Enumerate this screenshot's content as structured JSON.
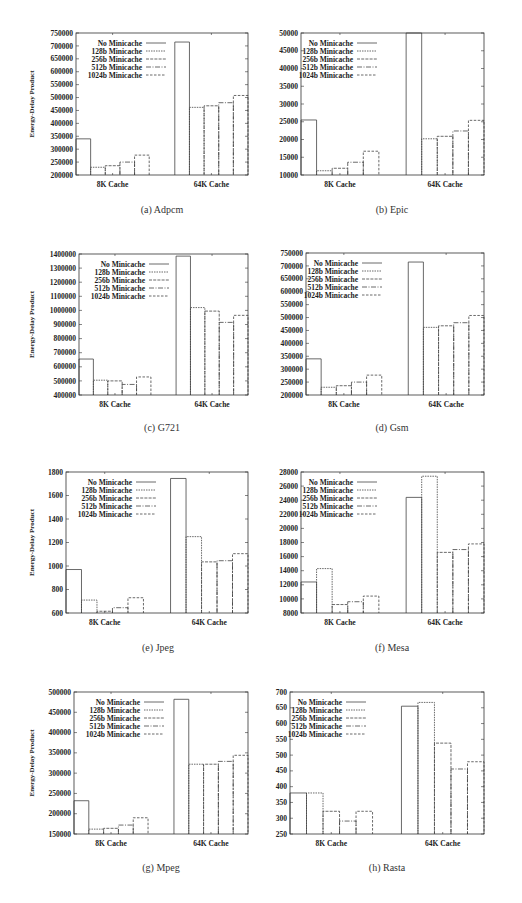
{
  "chart_data": [
    {
      "id": "a",
      "type": "bar",
      "title": "(a) Adpcm",
      "xlabel": "",
      "ylabel": "Energy-Delay Product",
      "categories": [
        "8K Cache",
        "64K Cache"
      ],
      "ylim": [
        200000,
        750000
      ],
      "yticks": [
        200000,
        250000,
        300000,
        350000,
        400000,
        450000,
        500000,
        550000,
        600000,
        650000,
        700000,
        750000
      ],
      "legend_position": "top-left",
      "grid": false,
      "series": [
        {
          "name": "No Minicache",
          "values": [
            340000,
            715000
          ]
        },
        {
          "name": "128b Minicache",
          "values": [
            230000,
            462000
          ]
        },
        {
          "name": "256b Minicache",
          "values": [
            236000,
            468000
          ]
        },
        {
          "name": "512b Minicache",
          "values": [
            250000,
            480000
          ]
        },
        {
          "name": "1024b Minicache",
          "values": [
            277000,
            508000
          ]
        }
      ]
    },
    {
      "id": "b",
      "type": "bar",
      "title": "(b) Epic",
      "xlabel": "",
      "ylabel": "",
      "categories": [
        "8K Cache",
        "64K Cache"
      ],
      "ylim": [
        10000,
        50000
      ],
      "yticks": [
        10000,
        15000,
        20000,
        25000,
        30000,
        35000,
        40000,
        45000,
        50000
      ],
      "legend_position": "top-left",
      "grid": false,
      "series": [
        {
          "name": "No Minicache",
          "values": [
            25500,
            50000
          ]
        },
        {
          "name": "128b Minicache",
          "values": [
            11200,
            20200
          ]
        },
        {
          "name": "256b Minicache",
          "values": [
            11900,
            20900
          ]
        },
        {
          "name": "512b Minicache",
          "values": [
            13600,
            22400
          ]
        },
        {
          "name": "1024b Minicache",
          "values": [
            16700,
            25400
          ]
        }
      ]
    },
    {
      "id": "c",
      "type": "bar",
      "title": "(c) G721",
      "xlabel": "",
      "ylabel": "Energy-Delay Product",
      "categories": [
        "8K Cache",
        "64K Cache"
      ],
      "ylim": [
        400000,
        1400000
      ],
      "yticks": [
        400000,
        500000,
        600000,
        700000,
        800000,
        900000,
        1000000,
        1100000,
        1200000,
        1300000,
        1400000
      ],
      "legend_position": "top-left",
      "grid": false,
      "series": [
        {
          "name": "No Minicache",
          "values": [
            655000,
            1385000
          ]
        },
        {
          "name": "128b Minicache",
          "values": [
            505000,
            1020000
          ]
        },
        {
          "name": "256b Minicache",
          "values": [
            500000,
            995000
          ]
        },
        {
          "name": "512b Minicache",
          "values": [
            475000,
            915000
          ]
        },
        {
          "name": "1024b Minicache",
          "values": [
            528000,
            965000
          ]
        }
      ]
    },
    {
      "id": "d",
      "type": "bar",
      "title": "(d) Gsm",
      "xlabel": "",
      "ylabel": "",
      "categories": [
        "8K Cache",
        "64K Cache"
      ],
      "ylim": [
        200000,
        750000
      ],
      "yticks": [
        200000,
        250000,
        300000,
        350000,
        400000,
        450000,
        500000,
        550000,
        600000,
        650000,
        700000,
        750000
      ],
      "legend_position": "top-left",
      "grid": false,
      "series": [
        {
          "name": "No Minicache",
          "values": [
            340000,
            715000
          ]
        },
        {
          "name": "128b Minicache",
          "values": [
            230000,
            462000
          ]
        },
        {
          "name": "256b Minicache",
          "values": [
            236000,
            468000
          ]
        },
        {
          "name": "512b Minicache",
          "values": [
            250000,
            480000
          ]
        },
        {
          "name": "1024b Minicache",
          "values": [
            277000,
            508000
          ]
        }
      ]
    },
    {
      "id": "e",
      "type": "bar",
      "title": "(e) Jpeg",
      "xlabel": "",
      "ylabel": "Energy-Delay Product",
      "categories": [
        "8K Cache",
        "64K Cache"
      ],
      "ylim": [
        600,
        1800
      ],
      "yticks": [
        600,
        800,
        1000,
        1200,
        1400,
        1600,
        1800
      ],
      "legend_position": "top-left",
      "grid": false,
      "series": [
        {
          "name": "No Minicache",
          "values": [
            970,
            1745
          ]
        },
        {
          "name": "128b Minicache",
          "values": [
            710,
            1250
          ]
        },
        {
          "name": "256b Minicache",
          "values": [
            615,
            1035
          ]
        },
        {
          "name": "512b Minicache",
          "values": [
            645,
            1045
          ]
        },
        {
          "name": "1024b Minicache",
          "values": [
            730,
            1105
          ]
        }
      ]
    },
    {
      "id": "f",
      "type": "bar",
      "title": "(f) Mesa",
      "xlabel": "",
      "ylabel": "",
      "categories": [
        "8K Cache",
        "64K Cache"
      ],
      "ylim": [
        8000,
        28000
      ],
      "yticks": [
        8000,
        10000,
        12000,
        14000,
        16000,
        18000,
        20000,
        22000,
        24000,
        26000,
        28000
      ],
      "legend_position": "top-left",
      "grid": false,
      "series": [
        {
          "name": "No Minicache",
          "values": [
            12400,
            24400
          ]
        },
        {
          "name": "128b Minicache",
          "values": [
            14300,
            27400
          ]
        },
        {
          "name": "256b Minicache",
          "values": [
            9200,
            16600
          ]
        },
        {
          "name": "512b Minicache",
          "values": [
            9600,
            17000
          ]
        },
        {
          "name": "1024b Minicache",
          "values": [
            10400,
            17800
          ]
        }
      ]
    },
    {
      "id": "g",
      "type": "bar",
      "title": "(g) Mpeg",
      "xlabel": "",
      "ylabel": "Energy-Delay Product",
      "categories": [
        "8K Cache",
        "64K Cache"
      ],
      "ylim": [
        150000,
        500000
      ],
      "yticks": [
        150000,
        200000,
        250000,
        300000,
        350000,
        400000,
        450000,
        500000
      ],
      "legend_position": "top-left",
      "grid": false,
      "series": [
        {
          "name": "No Minicache",
          "values": [
            232000,
            482000
          ]
        },
        {
          "name": "128b Minicache",
          "values": [
            162000,
            322000
          ]
        },
        {
          "name": "256b Minicache",
          "values": [
            164000,
            322000
          ]
        },
        {
          "name": "512b Minicache",
          "values": [
            172000,
            329000
          ]
        },
        {
          "name": "1024b Minicache",
          "values": [
            190000,
            344000
          ]
        }
      ]
    },
    {
      "id": "h",
      "type": "bar",
      "title": "(h) Rasta",
      "xlabel": "",
      "ylabel": "",
      "categories": [
        "8K Cache",
        "64K Cache"
      ],
      "ylim": [
        250,
        700
      ],
      "yticks": [
        250,
        300,
        350,
        400,
        450,
        500,
        550,
        600,
        650,
        700
      ],
      "legend_position": "top-left",
      "grid": false,
      "series": [
        {
          "name": "No Minicache",
          "values": [
            380,
            655
          ]
        },
        {
          "name": "128b Minicache",
          "values": [
            380,
            667
          ]
        },
        {
          "name": "256b Minicache",
          "values": [
            322,
            538
          ]
        },
        {
          "name": "512b Minicache",
          "values": [
            291,
            456
          ]
        },
        {
          "name": "1024b Minicache",
          "values": [
            322,
            479
          ]
        }
      ]
    }
  ],
  "panels": [
    {
      "caption": "(a) Adpcm"
    },
    {
      "caption": "(b) Epic"
    },
    {
      "caption": "(c) G721"
    },
    {
      "caption": "(d) Gsm"
    },
    {
      "caption": "(e) Jpeg"
    },
    {
      "caption": "(f) Mesa"
    },
    {
      "caption": "(g) Mpeg"
    },
    {
      "caption": "(h) Rasta"
    }
  ],
  "style": {
    "axis_color": "#333333",
    "bar_stroke": "#444444",
    "bar_fill": "#ffffff",
    "series_dash": [
      "",
      "1.5,1",
      "3,1.2",
      "5,1.5,1,1.5",
      "2.5,1.5"
    ]
  }
}
